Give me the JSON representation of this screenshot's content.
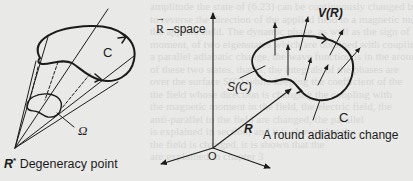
{
  "figure": {
    "colors": {
      "background": "#e9e9e7",
      "ink": "#1b1b1b",
      "bleed_text": "#d6d6d3"
    },
    "left_panel": {
      "loop_label": "C",
      "solid_angle_label": "Ω",
      "apex_symbol": "R",
      "apex_superscript": "*",
      "apex_caption": "Degeneracy point"
    },
    "space_label": {
      "vector_symbol": "R",
      "arrow_mark": "→",
      "text": "–space"
    },
    "right_panel": {
      "origin_label": "O",
      "position_vector_label": "R",
      "surface_label": "S(C)",
      "field_label": "V(R)",
      "loop_label": "C",
      "caption": "A round adiabatic change"
    }
  },
  "bleed_through": [
    "amplitude the state of (6.23) can be continuously changed by changing",
    "to reverse the direction of the applied field to a magnetic moment or",
    "the applied field. The dynamic phase, as well as the sign of the",
    "moment, of two eigenstates which are obtained with coupling and",
    "a parallel adiabatic change, the wave function is in the around",
    "of these two states, that is, the integrals of the phases are",
    "over the surface S(C) while keeping the coefficient of the",
    "the field whose direction is changing the coupling with",
    "the magnetic moment in the field, the electric field, the",
    "anti-parallel to the field are changed, the parallel",
    "is explained in section, and it is shown that the",
    "the field is changed, it is shown that the",
    "are explained in chapter 3"
  ]
}
